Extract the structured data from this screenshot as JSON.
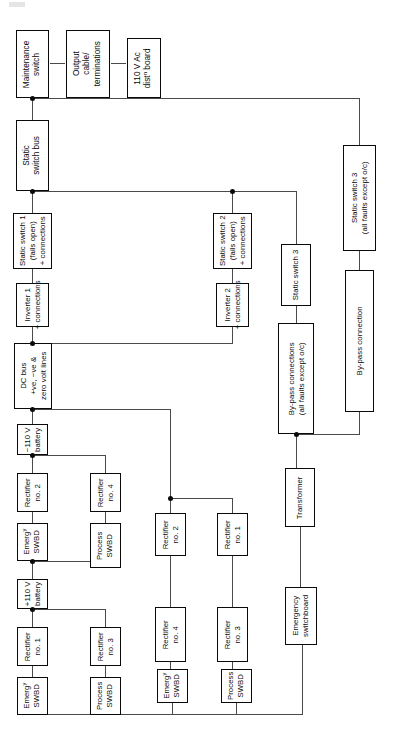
{
  "diagram": {
    "orientation": "rotated-90",
    "page_mark": "",
    "colors": {
      "box_border": "#0a0a0a",
      "line": "#4a4a4a",
      "node_dot": "#0a0a0a",
      "background": "#ffffff"
    },
    "boxes": [
      {
        "id": "maintenance-switch",
        "label": "Maintenance\nswitch"
      },
      {
        "id": "output-cable-terminations",
        "label": "Output\ncable/\nterminations"
      },
      {
        "id": "ac-dist-board",
        "label": "110 V Ac\ndist<sup>n</sup> board"
      },
      {
        "id": "static-switch-bus",
        "label": "Static\nswitch bus"
      },
      {
        "id": "static-switch-1",
        "label": "Static switch 1\n(fails open)\n+ connections"
      },
      {
        "id": "inverter-1",
        "label": "Inverter 1\n+ connections"
      },
      {
        "id": "dc-bus",
        "label": "DC bus\n+ve, −ve &\nzero volt lines"
      },
      {
        "id": "battery-minus-110",
        "label": "−110 V\nbattery"
      },
      {
        "id": "rectifier-no-2-left",
        "label": "Rectifier\nno. 2"
      },
      {
        "id": "rectifier-no-4-left",
        "label": "Rectifier\nno. 4"
      },
      {
        "id": "emerg-swbd-a",
        "label": "Emerg<sup>y</sup>\nSWBD"
      },
      {
        "id": "process-swbd-a",
        "label": "Process\nSWBD"
      },
      {
        "id": "battery-plus-110",
        "label": "+110 V\nbattery"
      },
      {
        "id": "rectifier-no-1-left",
        "label": "Rectifier\nno. 1"
      },
      {
        "id": "rectifier-no-3-left",
        "label": "Rectifier\nno. 3"
      },
      {
        "id": "emerg-swbd-b",
        "label": "Emerg<sup>y</sup>\nSWBD"
      },
      {
        "id": "process-swbd-b",
        "label": "Process\nSWBD"
      },
      {
        "id": "static-switch-2",
        "label": "Static switch 2\n(fails open)\n+ connections"
      },
      {
        "id": "inverter-2",
        "label": "Inverter 2\n+ connections"
      },
      {
        "id": "rectifier-no-2-mid",
        "label": "Rectifier\nno. 2"
      },
      {
        "id": "rectifier-no-4-mid",
        "label": "Rectifier\nno. 4"
      },
      {
        "id": "emerg-swbd-c",
        "label": "Emerg<sup>y</sup>\nSWBD"
      },
      {
        "id": "rectifier-no-1-mid",
        "label": "Rectifier\nno. 1"
      },
      {
        "id": "rectifier-no-3-mid",
        "label": "Rectifier\nno. 3"
      },
      {
        "id": "process-swbd-c",
        "label": "Process\nSWBD"
      },
      {
        "id": "static-switch-3-a",
        "label": "Static switch 3"
      },
      {
        "id": "bypass-connections",
        "label": "By-pass connections\n(all faults except o/c)"
      },
      {
        "id": "transformer",
        "label": "Transformer"
      },
      {
        "id": "emergency-switchboard",
        "label": "Emergency\nswitchboard"
      },
      {
        "id": "static-switch-3-b",
        "label": "Static switch 3\n(all faults except o/c)"
      },
      {
        "id": "bypass-connection",
        "label": "By-pass connection"
      }
    ]
  }
}
